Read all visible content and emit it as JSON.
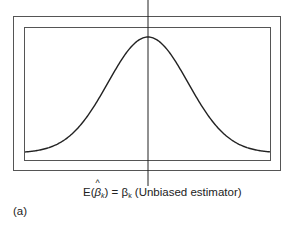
{
  "chart_data": {
    "type": "line",
    "title": "",
    "xlabel": "E(β̂k) = βk (Unbiased estimator)",
    "ylabel": "",
    "panel_label": "(a)",
    "grid": false,
    "legend": null,
    "distribution": "normal",
    "mean_marker": "E(β̂k) = βk",
    "x": [
      -3,
      -2.5,
      -2,
      -1.5,
      -1,
      -0.5,
      0,
      0.5,
      1,
      1.5,
      2,
      2.5,
      3
    ],
    "values": [
      0.011,
      0.044,
      0.135,
      0.325,
      0.607,
      0.882,
      1.0,
      0.882,
      0.607,
      0.325,
      0.135,
      0.044,
      0.011
    ]
  },
  "labels": {
    "caption_prefix": "E(",
    "caption_beta": "β",
    "caption_hat": "^",
    "caption_sub": "k",
    "caption_mid": ") = β",
    "caption_sub2": "k",
    "caption_suffix": " (Unbiased estimator)",
    "panel": "(a)"
  },
  "colors": {
    "line": "#222222",
    "frame": "#555555"
  }
}
